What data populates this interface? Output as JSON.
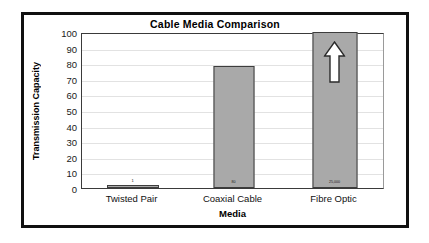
{
  "chart_data": {
    "type": "bar",
    "title": "Cable Media Comparison",
    "xlabel": "Media",
    "ylabel": "Transmission Capacity",
    "categories": [
      "Twisted Pair",
      "Coaxial Cable",
      "Fibre Optic"
    ],
    "values": [
      1,
      78,
      100
    ],
    "point_labels": [
      "1",
      "80",
      "25,000"
    ],
    "ylim": [
      0,
      100
    ],
    "ytick_labels": [
      "0",
      "10",
      "20",
      "30",
      "40",
      "50",
      "60",
      "70",
      "80",
      "90",
      "100"
    ],
    "ytick_values": [
      0,
      10,
      20,
      30,
      40,
      50,
      60,
      70,
      80,
      90,
      100
    ],
    "grid": true,
    "legend": "none",
    "annotations": [
      {
        "series": "Fibre Optic",
        "icon": "up-arrow-icon",
        "meaning": "value exceeds axis maximum"
      }
    ],
    "colors": {
      "bar_fill": "#a9a9a9",
      "bar_border": "#3d3d3d",
      "frame": "#101010",
      "gridline": "#e2e2e2",
      "text": "#000000"
    }
  }
}
